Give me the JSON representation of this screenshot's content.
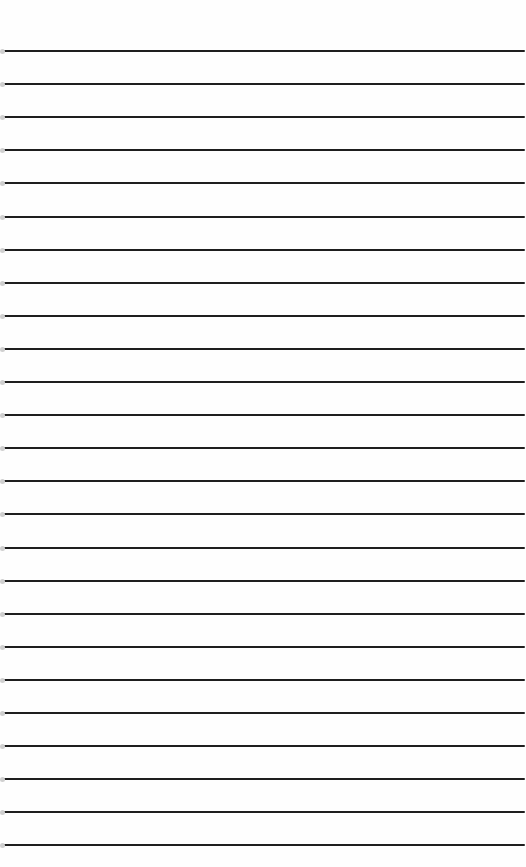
{
  "page": {
    "type": "lined-paper",
    "rule_count": 25,
    "background_color": "#fefefe",
    "rule_color": "#1e1e1e"
  }
}
